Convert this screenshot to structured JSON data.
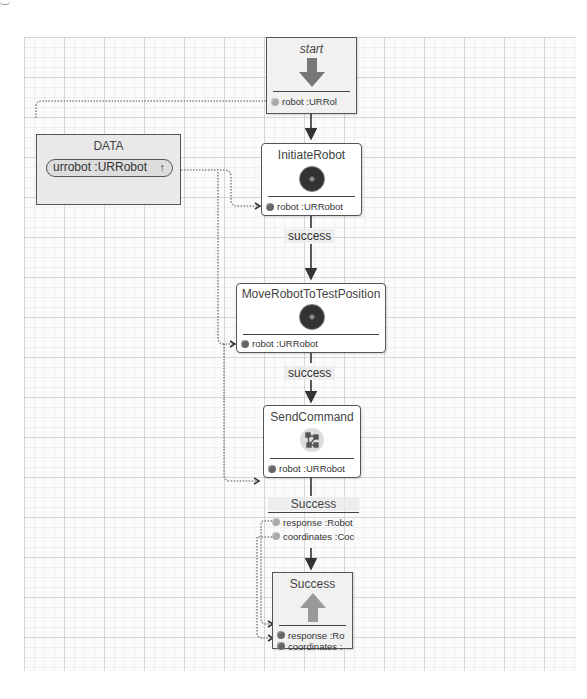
{
  "diagram": {
    "data_panel": {
      "title": "DATA",
      "variable": "urrobot :URRobot",
      "variable_icon": "up-arrow-icon"
    },
    "nodes": [
      {
        "id": "start",
        "title": "start",
        "icon": "down-arrow-icon",
        "ports": [
          "robot :URRol"
        ]
      },
      {
        "id": "initiate",
        "title": "InitiateRobot",
        "icon": "gear-icon",
        "ports": [
          "robot :URRobot"
        ]
      },
      {
        "id": "move",
        "title": "MoveRobotToTestPosition",
        "icon": "gear-icon",
        "ports": [
          "robot :URRobot"
        ]
      },
      {
        "id": "send",
        "title": "SendCommand",
        "icon": "network-icon",
        "ports": [
          "robot :URRobot"
        ]
      },
      {
        "id": "end",
        "title": "Success",
        "icon": "up-arrow-icon",
        "ports": [
          "response :Ro",
          "coordinates :"
        ]
      }
    ],
    "outcome_block": {
      "title": "Success",
      "ports": [
        "response :Robot",
        "coordinates :Coc"
      ]
    },
    "edge_labels": [
      "success",
      "success"
    ],
    "colors": {
      "node_border": "#555555",
      "arrow_fill": "#777777",
      "end_arrow_fill": "#999999",
      "data_wire": "#888888",
      "grid": "#d8d8d8"
    }
  }
}
